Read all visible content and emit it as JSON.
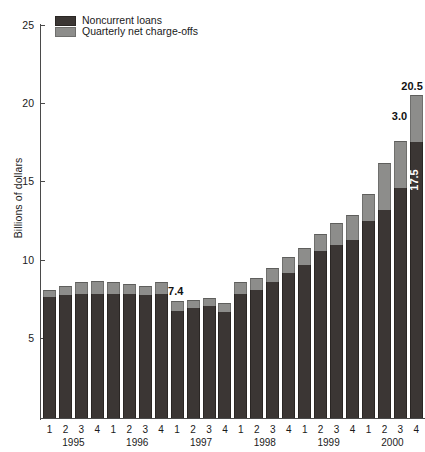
{
  "chart_data": {
    "type": "bar",
    "title": "",
    "subtitle": "",
    "xlabel": "",
    "ylabel": "Billions of dollars",
    "ylim": [
      0,
      25
    ],
    "yticks": [
      5,
      10,
      15,
      20,
      25
    ],
    "ytick_labels": [
      "5",
      "10",
      "15",
      "20",
      "25"
    ],
    "grid": false,
    "stacked": true,
    "legend_position": "top-left",
    "legend": [
      "Noncurrent loans",
      "Quarterly net charge-offs"
    ],
    "categories": [
      "1995 Q1",
      "1995 Q2",
      "1995 Q3",
      "1995 Q4",
      "1996 Q1",
      "1996 Q2",
      "1996 Q3",
      "1996 Q4",
      "1997 Q1",
      "1997 Q2",
      "1997 Q3",
      "1997 Q4",
      "1998 Q1",
      "1998 Q2",
      "1998 Q3",
      "1998 Q4",
      "1999 Q1",
      "1999 Q2",
      "1999 Q3",
      "1999 Q4",
      "2000 Q1",
      "2000 Q2",
      "2000 Q3",
      "2000 Q4"
    ],
    "quarter_labels": [
      "1",
      "2",
      "3",
      "4",
      "1",
      "2",
      "3",
      "4",
      "1",
      "2",
      "3",
      "4",
      "1",
      "2",
      "3",
      "4",
      "1",
      "2",
      "3",
      "4",
      "1",
      "2",
      "3",
      "4"
    ],
    "year_labels": [
      "1995",
      "1996",
      "1997",
      "1998",
      "1999",
      "2000"
    ],
    "series": [
      {
        "name": "Noncurrent loans",
        "color": "#3b3634",
        "values": [
          7.7,
          7.8,
          7.9,
          7.9,
          7.9,
          7.9,
          7.8,
          7.9,
          6.8,
          7.0,
          7.1,
          6.7,
          7.9,
          8.1,
          8.6,
          9.2,
          9.7,
          10.6,
          11.0,
          11.3,
          12.5,
          13.2,
          14.6,
          17.5
        ]
      },
      {
        "name": "Quarterly net charge-offs",
        "color": "#8d8d8b",
        "values": [
          0.4,
          0.6,
          0.7,
          0.8,
          0.7,
          0.6,
          0.6,
          0.7,
          0.6,
          0.5,
          0.5,
          0.6,
          0.7,
          0.8,
          0.9,
          1.0,
          1.1,
          1.1,
          1.4,
          1.6,
          1.7,
          3.0,
          3.0,
          3.0
        ]
      }
    ],
    "totals": [
      8.1,
      8.4,
      8.6,
      8.7,
      8.6,
      8.5,
      8.4,
      8.6,
      7.4,
      7.5,
      7.6,
      7.3,
      8.6,
      8.9,
      9.5,
      10.2,
      10.8,
      11.7,
      12.4,
      12.9,
      14.2,
      16.2,
      17.6,
      20.5
    ],
    "annotations": [
      {
        "text": "7.4",
        "type": "total-label",
        "bar_index": 8
      },
      {
        "text": "20.5",
        "type": "total-label",
        "bar_index": 23
      },
      {
        "text": "3.0",
        "type": "segment-label",
        "bar_index": 23,
        "series": "Quarterly net charge-offs"
      },
      {
        "text": "17.5",
        "type": "segment-label",
        "bar_index": 23,
        "series": "Noncurrent loans"
      }
    ]
  },
  "axis": {
    "y_title": "Billions of dollars",
    "y_ticks": [
      "25",
      "20",
      "15",
      "10",
      "5"
    ]
  },
  "legend": {
    "items": [
      {
        "label": "Noncurrent loans",
        "swatch": "dark-gray-swatch"
      },
      {
        "label": "Quarterly net charge-offs",
        "swatch": "light-gray-swatch"
      }
    ]
  },
  "annotations": {
    "low_point": "7.4",
    "peak_total": "20.5",
    "peak_chargeoffs": "3.0",
    "peak_noncurrent": "17.5"
  },
  "xaxis": {
    "quarters": [
      "1",
      "2",
      "3",
      "4",
      "1",
      "2",
      "3",
      "4",
      "1",
      "2",
      "3",
      "4",
      "1",
      "2",
      "3",
      "4",
      "1",
      "2",
      "3",
      "4",
      "1",
      "2",
      "3",
      "4"
    ],
    "years": [
      "1995",
      "1996",
      "1997",
      "1998",
      "1999",
      "2000"
    ]
  }
}
